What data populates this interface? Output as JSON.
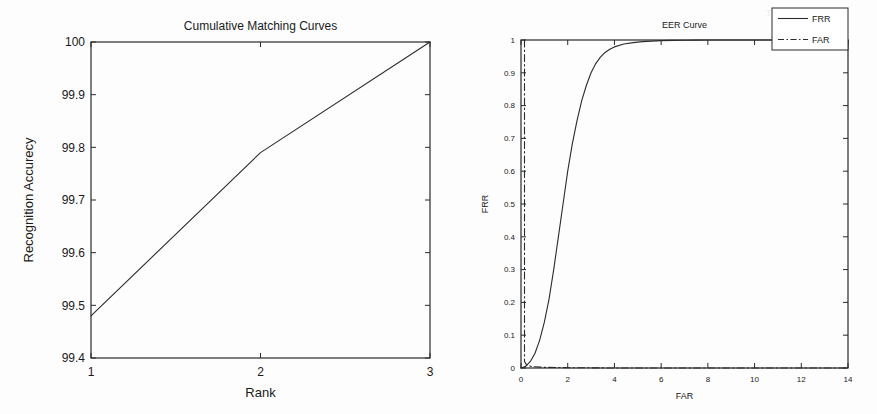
{
  "page": {
    "background_color": "#fdfdfd",
    "line_color": "#2b2b2b",
    "text_color": "#1a1a1a"
  },
  "figures": [
    {
      "id": "cmc",
      "title": "Cumulative Matching Curves",
      "xlabel": "Rank",
      "ylabel": "Recognition Accurecy"
    },
    {
      "id": "eer",
      "title": "EER Curve",
      "xlabel": "FAR",
      "ylabel": "FRR"
    }
  ],
  "ghost_text": {
    "top_right": "Tuning",
    "mid_left": "the"
  },
  "chart_data": [
    {
      "type": "line",
      "title": "Cumulative Matching Curves",
      "xlabel": "Rank",
      "ylabel": "Recognition Accurecy",
      "xlim": [
        1,
        3
      ],
      "ylim": [
        99.4,
        100
      ],
      "xticks": [
        1,
        2,
        3
      ],
      "xticklabels": [
        "1",
        "2",
        "3"
      ],
      "yticks": [
        99.4,
        99.5,
        99.6,
        99.7,
        99.8,
        99.9,
        100
      ],
      "yticklabels": [
        "99.4",
        "99.5",
        "99.6",
        "99.7",
        "99.8",
        "99.9",
        "100"
      ],
      "grid": false,
      "legend": null,
      "series": [
        {
          "name": "CMC",
          "style": "solid",
          "color": "#2b2b2b",
          "x": [
            1,
            2,
            3
          ],
          "y": [
            99.48,
            99.79,
            100.0
          ]
        }
      ]
    },
    {
      "type": "line",
      "title": "EER Curve",
      "xlabel": "FAR",
      "ylabel": "FRR",
      "xlim": [
        0,
        14
      ],
      "ylim": [
        0,
        1
      ],
      "xticks": [
        0,
        2,
        4,
        6,
        8,
        10,
        12,
        14
      ],
      "xticklabels": [
        "0",
        "2",
        "4",
        "6",
        "8",
        "10",
        "12",
        "14"
      ],
      "yticks": [
        0,
        0.1,
        0.2,
        0.3,
        0.4,
        0.5,
        0.6,
        0.7,
        0.8,
        0.9,
        1
      ],
      "yticklabels": [
        "0",
        "0.1",
        "0.2",
        "0.3",
        "0.4",
        "0.5",
        "0.6",
        "0.7",
        "0.8",
        "0.9",
        "1"
      ],
      "grid": false,
      "legend": {
        "position": "top-right",
        "entries": [
          {
            "label": "FRR",
            "style": "solid"
          },
          {
            "label": "FAR",
            "style": "dashdot"
          }
        ]
      },
      "series": [
        {
          "name": "FRR",
          "style": "solid",
          "color": "#2b2b2b",
          "x": [
            0.0,
            0.2,
            0.4,
            0.6,
            0.8,
            1.0,
            1.2,
            1.4,
            1.6,
            1.8,
            2.0,
            2.2,
            2.4,
            2.6,
            2.8,
            3.0,
            3.2,
            3.4,
            3.6,
            3.8,
            4.0,
            4.4,
            4.8,
            5.2,
            5.6,
            6.0,
            6.5,
            7.0,
            7.5,
            8.0,
            9.0,
            10.0,
            12.0,
            14.0
          ],
          "y": [
            0.0,
            0.005,
            0.02,
            0.045,
            0.085,
            0.14,
            0.21,
            0.3,
            0.4,
            0.5,
            0.6,
            0.685,
            0.755,
            0.815,
            0.862,
            0.9,
            0.928,
            0.948,
            0.962,
            0.972,
            0.979,
            0.988,
            0.992,
            0.995,
            0.9965,
            0.998,
            0.9988,
            0.9993,
            0.9996,
            0.9998,
            1.0,
            1.0,
            1.0,
            1.0
          ]
        },
        {
          "name": "FAR",
          "style": "dashdot",
          "color": "#2b2b2b",
          "x": [
            0.15,
            0.15,
            0.25,
            0.5,
            1.0,
            2.0,
            4.0,
            6.0,
            8.0,
            10.0,
            12.0,
            14.0
          ],
          "y": [
            1.0,
            0.02,
            0.008,
            0.004,
            0.002,
            0.001,
            0.0,
            0.0,
            0.0,
            0.0,
            0.0,
            0.0
          ]
        }
      ]
    }
  ]
}
